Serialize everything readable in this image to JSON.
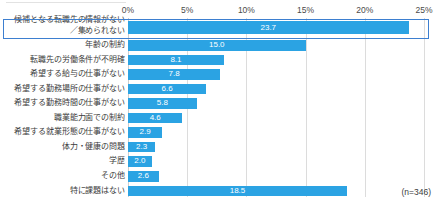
{
  "chart_data": {
    "type": "bar",
    "orientation": "horizontal",
    "title": "",
    "subtitle": "",
    "xlabel": "",
    "ylabel": "",
    "xlim": [
      0,
      25
    ],
    "grid": true,
    "legend": null,
    "value_suffix": "%",
    "tick_labels": [
      "0%",
      "5%",
      "10%",
      "15%",
      "20%",
      "25%"
    ],
    "ticks": [
      0,
      5,
      10,
      15,
      20,
      25
    ],
    "categories": [
      "候補となる転職先の情報がない／集められない",
      "年齢の制約",
      "転職先の労働条件が不明確",
      "希望する給与の仕事がない",
      "希望する勤務場所の仕事がない",
      "希望する勤務時間の仕事がない",
      "職業能力面での制約",
      "希望する就業形態の仕事がない",
      "体力・健康の問題",
      "学歴",
      "その他",
      "特に課題はない"
    ],
    "values": [
      23.7,
      15.0,
      8.1,
      7.8,
      6.6,
      5.8,
      4.6,
      2.9,
      2.3,
      2.0,
      2.6,
      18.5
    ],
    "annotation": "(n=346)",
    "highlighted_index": 0,
    "colors": {
      "bar": "#2ba3e3",
      "highlight_border": "#3d7fd0",
      "gridline": "#dcdcdc",
      "text": "#3c3c3c",
      "value_text": "#ffffff"
    }
  },
  "rows": [
    {
      "label_line1": "候補となる転職先の情報がない",
      "label_line2": "／集められない",
      "value": "23.7",
      "two_line": true
    },
    {
      "label_line1": "年齢の制約",
      "label_line2": "",
      "value": "15.0",
      "two_line": false
    },
    {
      "label_line1": "転職先の労働条件が不明確",
      "label_line2": "",
      "value": "8.1",
      "two_line": false
    },
    {
      "label_line1": "希望する給与の仕事がない",
      "label_line2": "",
      "value": "7.8",
      "two_line": false
    },
    {
      "label_line1": "希望する勤務場所の仕事がない",
      "label_line2": "",
      "value": "6.6",
      "two_line": false
    },
    {
      "label_line1": "希望する勤務時間の仕事がない",
      "label_line2": "",
      "value": "5.8",
      "two_line": false
    },
    {
      "label_line1": "職業能力面での制約",
      "label_line2": "",
      "value": "4.6",
      "two_line": false
    },
    {
      "label_line1": "希望する就業形態の仕事がない",
      "label_line2": "",
      "value": "2.9",
      "two_line": false
    },
    {
      "label_line1": "体力・健康の問題",
      "label_line2": "",
      "value": "2.3",
      "two_line": false
    },
    {
      "label_line1": "学歴",
      "label_line2": "",
      "value": "2.0",
      "two_line": false
    },
    {
      "label_line1": "その他",
      "label_line2": "",
      "value": "2.6",
      "two_line": false
    },
    {
      "label_line1": "特に課題はない",
      "label_line2": "",
      "value": "18.5",
      "two_line": false
    }
  ],
  "note": {
    "sample_size": "(n=346)"
  }
}
